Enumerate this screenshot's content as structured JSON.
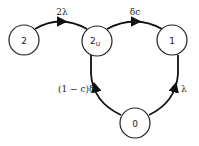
{
  "diagram": {
    "type": "state-transition",
    "nodes": [
      {
        "id": "2",
        "label": "2",
        "sub": ""
      },
      {
        "id": "2U",
        "label": "2",
        "sub": "U"
      },
      {
        "id": "1",
        "label": "1",
        "sub": ""
      },
      {
        "id": "0",
        "label": "0",
        "sub": ""
      }
    ],
    "edges": [
      {
        "from": "2",
        "to": "2U",
        "label": "2λ"
      },
      {
        "from": "2U",
        "to": "1",
        "label": "δc"
      },
      {
        "from": "2U",
        "to": "0",
        "label": "(1 − c)δ"
      },
      {
        "from": "0",
        "to": "1",
        "label": "λ"
      }
    ],
    "colors": {
      "stroke": "#111111",
      "fill": "#ffffff",
      "text": "#222222"
    }
  }
}
